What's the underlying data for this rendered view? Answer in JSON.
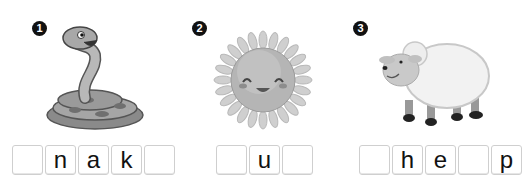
{
  "exercises": [
    {
      "number": "1",
      "picture": "snake-illustration",
      "letters": [
        "",
        "n",
        "a",
        "k",
        ""
      ]
    },
    {
      "number": "2",
      "picture": "sun-illustration",
      "letters": [
        "",
        "u",
        ""
      ]
    },
    {
      "number": "3",
      "picture": "sheep-illustration",
      "letters": [
        "",
        "h",
        "e",
        "",
        "p"
      ]
    }
  ]
}
